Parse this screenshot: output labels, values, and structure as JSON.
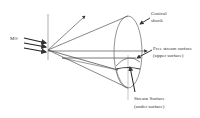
{
  "diagram": {
    "type": "conical shock flow schematic",
    "labels": {
      "mach": "M∞",
      "conical_shock_line1": "Conical",
      "conical_shock_line2": "shock",
      "free_stream_line1": "Free stream surface",
      "free_stream_line2": "(upper surface)",
      "stream_surface_line1": "Stream Surface",
      "stream_surface_line2": "(under surface)"
    },
    "colors": {
      "line": "#555555",
      "arrow": "#222222",
      "text": "#333333",
      "background": "#ffffff"
    }
  }
}
